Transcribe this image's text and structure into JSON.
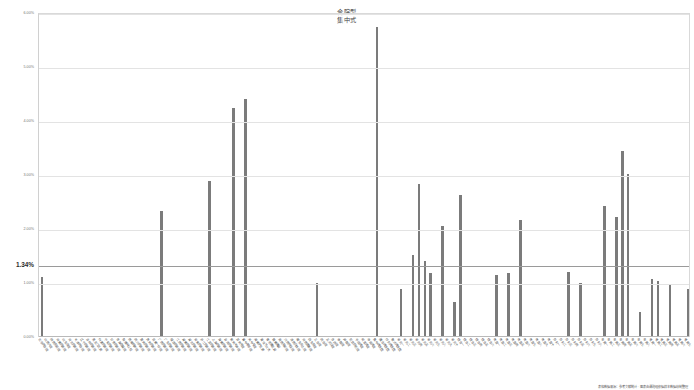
{
  "chart_data": {
    "type": "bar",
    "title": "合院型 集中式",
    "title_lines": [
      "合院型",
      "集中式"
    ],
    "subtitle": "",
    "xlabel": "",
    "ylabel": "",
    "ylim": [
      0.0,
      6.0
    ],
    "grid": true,
    "grid_axis": "y",
    "legend": null,
    "legend_position": "none",
    "y_tick_labels": [
      "6.00%",
      "5.00%",
      "4.00%",
      "3.00%",
      "2.00%",
      "1.00%",
      "0.00%"
    ],
    "y_tick_values": [
      6.0,
      5.0,
      4.0,
      3.0,
      2.0,
      1.0,
      0.0
    ],
    "value_unit": "%",
    "reference_line": {
      "label": "1.34%",
      "value": 1.34
    },
    "annotations": [
      {
        "text": "1.34%",
        "kind": "reference-line-label",
        "value": 1.34
      }
    ],
    "bar_color": "#7b7b7b",
    "series": [
      {
        "name": "占比",
        "values": [
          1.12,
          0.0,
          0.0,
          0.0,
          0.0,
          0.0,
          0.0,
          0.0,
          0.0,
          0.0,
          0.0,
          0.0,
          0.0,
          0.0,
          0.0,
          0.0,
          0.0,
          0.0,
          0.0,
          0.0,
          2.34,
          0.0,
          0.0,
          0.0,
          0.0,
          0.0,
          0.0,
          0.0,
          2.88,
          0.0,
          0.0,
          0.0,
          4.25,
          0.0,
          4.41,
          0.0,
          0.0,
          0.0,
          0.0,
          0.0,
          0.0,
          0.0,
          0.0,
          0.0,
          0.0,
          0.0,
          1.0,
          0.0,
          0.0,
          0.0,
          0.0,
          0.0,
          0.0,
          0.0,
          0.0,
          0.0,
          5.75,
          0.0,
          0.0,
          0.0,
          0.88,
          0.0,
          1.52,
          2.84,
          1.4,
          1.18,
          0.0,
          2.05,
          0.0,
          0.64,
          2.63,
          0.0,
          0.0,
          0.0,
          0.0,
          0.0,
          1.15,
          0.0,
          1.18,
          0.0,
          2.16,
          0.0,
          0.0,
          0.0,
          0.0,
          0.0,
          0.0,
          0.0,
          1.2,
          0.0,
          1.0,
          0.0,
          0.0,
          0.0,
          2.43,
          0.0,
          2.22,
          3.45,
          3.02,
          0.0,
          0.46,
          0.0,
          1.08,
          1.04,
          0.0,
          0.97,
          0.0,
          0.0,
          0.88
        ]
      }
    ],
    "categories": [
      "北京四合院",
      "山西大院",
      "陕西窑洞院",
      "河南民居院",
      "山东合院",
      "河北民居院",
      "天津四合院",
      "辽宁民居院",
      "吉林民居院",
      "黑龙江民居",
      "内蒙民居院",
      "宁夏民居院",
      "甘肃民居院",
      "青海庄窠院",
      "新疆阿以旺",
      "西藏碉房院",
      "四川民居院",
      "重庆民居院",
      "贵州民居院",
      "云南一印院",
      "广西民居院",
      "广东民居院",
      "福建民居院",
      "江西民居院",
      "湖南民居院",
      "湖北民居院",
      "安徽民居院",
      "浙江民居院",
      "江苏民居院",
      "上海民居院",
      "海南民居院",
      "台湾民居院",
      "徽州天井院",
      "苏州宅院",
      "晋中票号院",
      "关中窄院",
      "闽南护龙厝",
      "潮汕下山虎",
      "客家围龙屋",
      "赣南围屋",
      "湘西吊脚院",
      "川西林盘院",
      "滇西白族院",
      "藏东夯土院",
      "河西堡寨院",
      "陇东窑院",
      "三合院",
      "四合院",
      "五间过院",
      "多进院",
      "串联院",
      "并联院",
      "前店后宅院",
      "书院式院",
      "祠堂式院",
      "寺庙式院",
      "集中式组团",
      "围合式组团",
      "行列式组团",
      "散点式组团",
      "单元一",
      "单元二",
      "单元三",
      "单元四",
      "单元五",
      "单元六",
      "单元七",
      "单元八",
      "单元九",
      "单元十",
      "组合一",
      "组合二",
      "组合三",
      "组合四",
      "组合五",
      "组合六",
      "类型一",
      "类型二",
      "类型三",
      "类型四",
      "类型五",
      "类型六",
      "类型七",
      "类型八",
      "类型九",
      "类型十",
      "形制一",
      "形制二",
      "形制三",
      "形制四",
      "形制五",
      "形制六",
      "形制七",
      "形制八",
      "布局一",
      "布局二",
      "布局三",
      "布局四",
      "布局五",
      "布局六",
      "布局七",
      "布局八",
      "格局一",
      "格局二",
      "格局三",
      "格局四",
      "格局五",
      "格局六",
      "格局七"
    ]
  },
  "footnote": {
    "text": "表格数据来源：参考文献统计 · 图表由课题组依据样本数据绘制整理"
  }
}
